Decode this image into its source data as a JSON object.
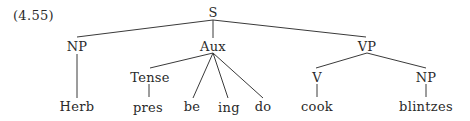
{
  "example_number": "(4.55)",
  "nodes": {
    "s": "S",
    "np_subject": "NP",
    "aux": "Aux",
    "vp": "VP",
    "tense": "Tense",
    "v": "V",
    "np_object": "NP",
    "herb": "Herb",
    "pres": "pres",
    "be": "be",
    "ing": "ing",
    "do": "do",
    "cook": "cook",
    "blintzes": "blintzes"
  },
  "edges": [
    [
      "S",
      "NP"
    ],
    [
      "S",
      "Aux"
    ],
    [
      "S",
      "VP"
    ],
    [
      "NP",
      "Herb"
    ],
    [
      "Aux",
      "Tense"
    ],
    [
      "Aux",
      "be"
    ],
    [
      "Aux",
      "ing"
    ],
    [
      "Aux",
      "do"
    ],
    [
      "Tense",
      "pres"
    ],
    [
      "VP",
      "V"
    ],
    [
      "VP",
      "NP"
    ],
    [
      "V",
      "cook"
    ],
    [
      "NP",
      "blintzes"
    ]
  ]
}
